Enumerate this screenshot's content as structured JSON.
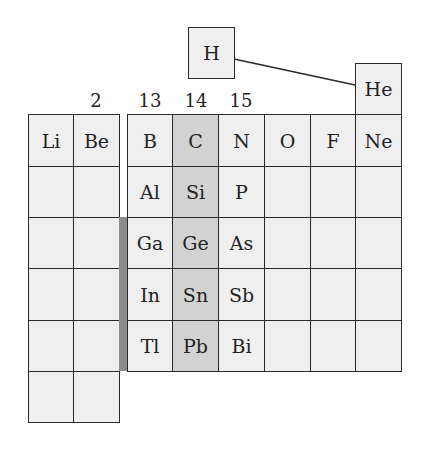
{
  "diagram": {
    "colors": {
      "cell_fill": "#efefef",
      "highlight_fill": "#d2d2d2",
      "border": "#2a2a2a",
      "divider_bar": "#8c8c8c"
    },
    "group_labels": [
      {
        "label": "2",
        "x": 96
      },
      {
        "label": "13",
        "x": 150
      },
      {
        "label": "14",
        "x": 196
      },
      {
        "label": "15",
        "x": 241
      }
    ],
    "hydrogen": {
      "symbol": "H"
    },
    "helium": {
      "symbol": "He"
    },
    "highlighted_group": "14",
    "left_block": {
      "columns": [
        "1",
        "2"
      ],
      "rows": [
        [
          "Li",
          "Be"
        ],
        [
          "",
          ""
        ],
        [
          "",
          ""
        ],
        [
          "",
          ""
        ],
        [
          "",
          ""
        ],
        [
          "",
          ""
        ]
      ]
    },
    "right_block": {
      "columns": [
        "13",
        "14",
        "15",
        "16",
        "17",
        "18"
      ],
      "rows": [
        [
          "B",
          "C",
          "N",
          "O",
          "F",
          "Ne"
        ],
        [
          "Al",
          "Si",
          "P",
          "",
          "",
          ""
        ],
        [
          "Ga",
          "Ge",
          "As",
          "",
          "",
          ""
        ],
        [
          "In",
          "Sn",
          "Sb",
          "",
          "",
          ""
        ],
        [
          "Tl",
          "Pb",
          "Bi",
          "",
          "",
          ""
        ]
      ]
    }
  }
}
